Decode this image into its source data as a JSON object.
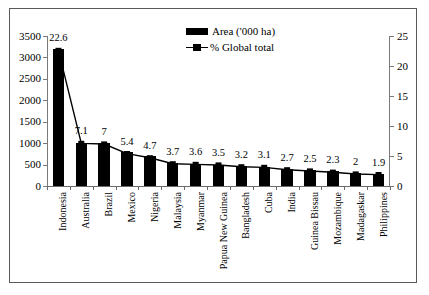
{
  "chart_data": {
    "type": "bar",
    "title": "",
    "xlabel": "",
    "ylabel": "Area ('000 ha)",
    "y2label": "% Global total",
    "ylim": [
      0,
      3500
    ],
    "y2lim": [
      0,
      25
    ],
    "grid": false,
    "legend_position": "top-center",
    "categories": [
      "Indonesia",
      "Australia",
      "Brazil",
      "Mexico",
      "Nigeria",
      "Malaysia",
      "Myanmar",
      "Papua New Guinea",
      "Bangladesh",
      "Cuba",
      "India",
      "Guinea Bissau",
      "Mozambique",
      "Madagaskar",
      "Philippines"
    ],
    "series": [
      {
        "name": "Area ('000 ha)",
        "type": "bar",
        "axis": "left",
        "values": [
          3200,
          1000,
          1000,
          790,
          690,
          540,
          520,
          500,
          470,
          450,
          400,
          370,
          340,
          300,
          280
        ]
      },
      {
        "name": "% Global total",
        "type": "line",
        "axis": "right",
        "values": [
          22.6,
          7.1,
          7,
          5.4,
          4.7,
          3.7,
          3.6,
          3.5,
          3.2,
          3.1,
          2.7,
          2.5,
          2.3,
          2,
          1.9
        ],
        "labels": [
          "22.6",
          "7.1",
          "7",
          "5.4",
          "4.7",
          "3.7",
          "3.6",
          "3.5",
          "3.2",
          "3.1",
          "2.7",
          "2.5",
          "2.3",
          "2",
          "1.9"
        ]
      }
    ],
    "yticks_left": [
      "0",
      "500",
      "1000",
      "1500",
      "2000",
      "2500",
      "3000",
      "3500"
    ],
    "yticks_right": [
      "0",
      "5",
      "10",
      "15",
      "20",
      "25"
    ],
    "colors": {
      "bar": "#000000",
      "line": "#000000",
      "axis": "#6a6a6a",
      "border": "#5a5a5a",
      "background": "#ffffff"
    }
  },
  "legend": {
    "items": [
      {
        "label": "Area ('000 ha)",
        "marker": "filled-rect"
      },
      {
        "label": "% Global total",
        "marker": "line-square"
      }
    ]
  }
}
